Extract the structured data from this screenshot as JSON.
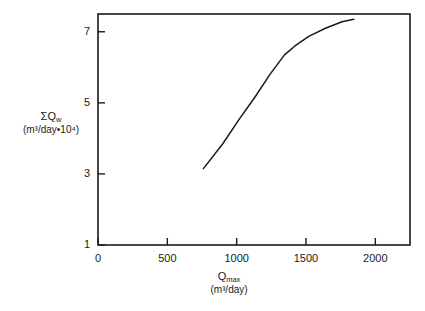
{
  "chart_data": {
    "type": "line",
    "title": "",
    "subtitle": "",
    "xlabel_line1": "Q",
    "xlabel_sub": "max",
    "xlabel_line2": "(m³/day)",
    "ylabel_line1_sigma": "ΣQ",
    "ylabel_sub": "w",
    "ylabel_line2": "(m³/day•10⁴)",
    "xlabel": "Qmax (m³/day)",
    "ylabel": "ΣQw (m³/day•10⁴)",
    "xlim": [
      0,
      2250
    ],
    "ylim": [
      1,
      7.5
    ],
    "xticks": [
      0,
      500,
      1000,
      1500,
      2000
    ],
    "xticklabels": [
      "0",
      "500",
      "1000",
      "1500",
      "2000"
    ],
    "yticks": [
      1,
      3,
      5,
      7
    ],
    "yticklabels": [
      "1",
      "3",
      "5",
      "7"
    ],
    "grid": false,
    "legend": null,
    "series": [
      {
        "name": "cumulative water production",
        "x": [
          760,
          900,
          1020,
          1130,
          1240,
          1345,
          1420,
          1520,
          1640,
          1760,
          1845
        ],
        "y": [
          3.15,
          3.85,
          4.55,
          5.15,
          5.8,
          6.35,
          6.6,
          6.87,
          7.1,
          7.28,
          7.35
        ]
      }
    ]
  },
  "axes": {
    "frame_color": "#1a1a1a",
    "curve_color": "#1a1a1a",
    "background": "#ffffff"
  }
}
